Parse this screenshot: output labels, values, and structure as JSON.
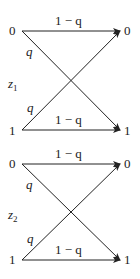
{
  "diagram": {
    "type": "binary-symmetric-channel",
    "channels": [
      {
        "name": "z1",
        "name_base": "z",
        "name_sub": "1",
        "input_labels": [
          "0",
          "1"
        ],
        "output_labels": [
          "0",
          "1"
        ],
        "edges": [
          {
            "from": "0",
            "to": "0",
            "label": "1 − q"
          },
          {
            "from": "0",
            "to": "1",
            "label": "q"
          },
          {
            "from": "1",
            "to": "0",
            "label": "q"
          },
          {
            "from": "1",
            "to": "1",
            "label": "1 − q"
          }
        ]
      },
      {
        "name": "z2",
        "name_base": "z",
        "name_sub": "2",
        "input_labels": [
          "0",
          "1"
        ],
        "output_labels": [
          "0",
          "1"
        ],
        "edges": [
          {
            "from": "0",
            "to": "0",
            "label": "1 − q"
          },
          {
            "from": "0",
            "to": "1",
            "label": "q"
          },
          {
            "from": "1",
            "to": "0",
            "label": "q"
          },
          {
            "from": "1",
            "to": "1",
            "label": "1 − q"
          }
        ]
      }
    ],
    "colors": {
      "stroke": "#222222",
      "background": "#ffffff"
    }
  }
}
